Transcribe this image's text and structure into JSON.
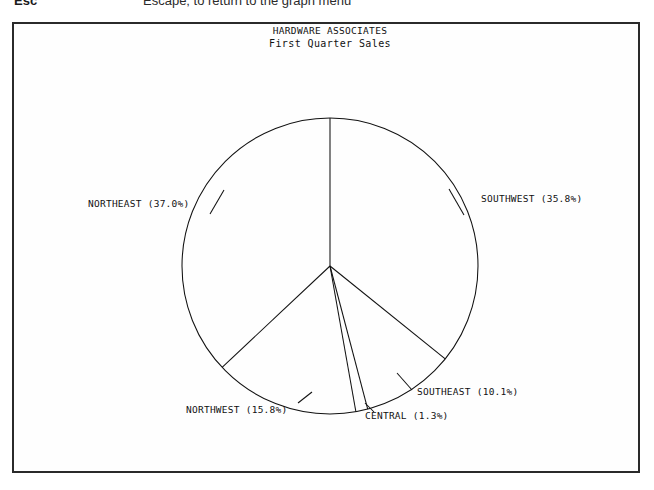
{
  "help_bar": {
    "key": "Esc",
    "description": "Escape; to return to the graph menu"
  },
  "chart_data": {
    "type": "pie",
    "title": "HARDWARE ASSOCIATES",
    "subtitle": "First Quarter Sales",
    "xlabel": "",
    "ylabel": "",
    "legend_position": "none",
    "grid": false,
    "start_angle_deg": 0,
    "direction": "clockwise",
    "units": "percent",
    "categories": [
      "SOUTHWEST",
      "SOUTHEAST",
      "CENTRAL",
      "NORTHWEST",
      "NORTHEAST"
    ],
    "values": [
      35.8,
      10.1,
      1.3,
      15.8,
      37.0
    ],
    "total": 100.0,
    "slices": [
      {
        "name": "SOUTHWEST",
        "value": 35.8,
        "label": "SOUTHWEST (35.8%)",
        "label_x": 467,
        "label_y": 178,
        "anchor": "start",
        "leader": [
          [
            450,
            191
          ],
          [
            435,
            165
          ]
        ]
      },
      {
        "name": "SOUTHEAST",
        "value": 10.1,
        "label": "SOUTHEAST (10.1%)",
        "label_x": 403,
        "label_y": 371,
        "anchor": "start",
        "leader": [
          [
            398,
            366
          ],
          [
            383,
            349
          ]
        ]
      },
      {
        "name": "CENTRAL",
        "value": 1.3,
        "label": "CENTRAL (1.3%)",
        "label_x": 351,
        "label_y": 395,
        "anchor": "start",
        "leader": [
          [
            360,
            388
          ],
          [
            351,
            379
          ]
        ]
      },
      {
        "name": "NORTHWEST",
        "value": 15.8,
        "label": "NORTHWEST (15.8%)",
        "label_x": 172,
        "label_y": 389,
        "anchor": "start",
        "leader": [
          [
            284,
            379
          ],
          [
            298,
            368
          ]
        ]
      },
      {
        "name": "NORTHEAST",
        "value": 37.0,
        "label": "NORTHEAST (37.0%)",
        "label_x": 74,
        "label_y": 183,
        "anchor": "start",
        "leader": [
          [
            196,
            190
          ],
          [
            210,
            166
          ]
        ]
      }
    ],
    "geometry": {
      "center_x": 316,
      "center_y": 242,
      "radius": 148
    }
  }
}
